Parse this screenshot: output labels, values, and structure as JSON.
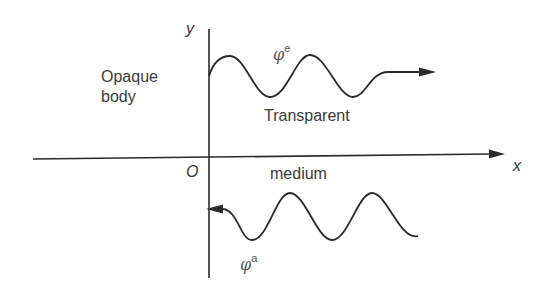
{
  "diagram": {
    "axes": {
      "y_label": "y",
      "x_label": "x",
      "origin_label": "O"
    },
    "regions": {
      "left_label_line1": "Opaque",
      "left_label_line2": "body",
      "right_label_line1": "Transparent",
      "right_label_line2": "medium"
    },
    "waves": {
      "emitted": {
        "symbol": "φ",
        "superscript": "e",
        "direction": "outgoing (+x)"
      },
      "absorbed": {
        "symbol": "φ",
        "superscript": "a",
        "direction": "incoming (-x)"
      }
    },
    "colors": {
      "line": "#2a2a2a",
      "background": "#ffffff"
    }
  }
}
